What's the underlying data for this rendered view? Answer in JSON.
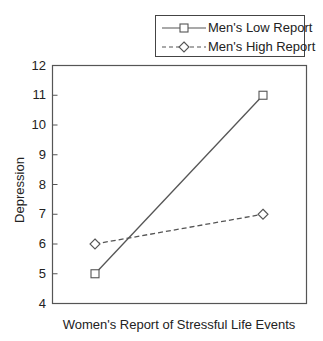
{
  "chart_data": {
    "type": "line",
    "title": "",
    "xlabel": "Women's Report of Stressful Life Events",
    "ylabel": "Depression",
    "ylim": [
      4,
      12
    ],
    "yticks": [
      4,
      5,
      6,
      7,
      8,
      9,
      10,
      11,
      12
    ],
    "x": [
      "Low",
      "High"
    ],
    "x_tick_labels_shown": false,
    "grid": false,
    "legend_position": "top-right, above plot",
    "series": [
      {
        "name": "Men's Low Report",
        "values": [
          5,
          11
        ],
        "line_style": "solid",
        "marker": "square",
        "color": "#555555"
      },
      {
        "name": "Men's High Report",
        "values": [
          6,
          7
        ],
        "line_style": "dashed",
        "marker": "diamond",
        "color": "#555555"
      }
    ]
  },
  "legend": {
    "items": [
      {
        "label": "Men's Low Report"
      },
      {
        "label": "Men's High Report"
      }
    ]
  },
  "axes": {
    "y_title": "Depression",
    "x_title": "Women's Report of Stressful Life Events",
    "y_tick_labels": [
      "4",
      "5",
      "6",
      "7",
      "8",
      "9",
      "10",
      "11",
      "12"
    ]
  }
}
